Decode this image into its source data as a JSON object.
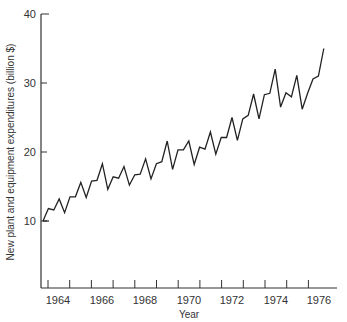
{
  "chart_data": {
    "type": "line",
    "title": "",
    "xlabel": "Year",
    "ylabel": "New plant and equipment expenditures (billion $)",
    "ylim": [
      0,
      40
    ],
    "xlim": [
      1963,
      1977
    ],
    "grid": false,
    "legend": null,
    "yticks": [
      10,
      20,
      30,
      40
    ],
    "xtick_labels": [
      "1964",
      "1966",
      "1968",
      "1970",
      "1972",
      "1974",
      "1976"
    ],
    "frequency": "quarterly",
    "x": [
      "1963Q1",
      "1963Q2",
      "1963Q3",
      "1963Q4",
      "1964Q1",
      "1964Q2",
      "1964Q3",
      "1964Q4",
      "1965Q1",
      "1965Q2",
      "1965Q3",
      "1965Q4",
      "1966Q1",
      "1966Q2",
      "1966Q3",
      "1966Q4",
      "1967Q1",
      "1967Q2",
      "1967Q3",
      "1967Q4",
      "1968Q1",
      "1968Q2",
      "1968Q3",
      "1968Q4",
      "1969Q1",
      "1969Q2",
      "1969Q3",
      "1969Q4",
      "1970Q1",
      "1970Q2",
      "1970Q3",
      "1970Q4",
      "1971Q1",
      "1971Q2",
      "1971Q3",
      "1971Q4",
      "1972Q1",
      "1972Q2",
      "1972Q3",
      "1972Q4",
      "1973Q1",
      "1973Q2",
      "1973Q3",
      "1973Q4",
      "1974Q1",
      "1974Q2",
      "1974Q3",
      "1974Q4",
      "1975Q1",
      "1975Q2",
      "1975Q3",
      "1975Q4",
      "1976Q1"
    ],
    "series": [
      {
        "name": "New plant and equipment expenditures",
        "values": [
          10.0,
          11.8,
          11.6,
          13.2,
          11.2,
          13.5,
          13.5,
          15.6,
          13.4,
          15.8,
          15.9,
          18.3,
          14.6,
          16.4,
          16.2,
          17.9,
          15.2,
          16.7,
          16.8,
          19.0,
          16.1,
          18.3,
          18.6,
          21.6,
          17.5,
          20.3,
          20.3,
          21.6,
          18.2,
          20.7,
          20.4,
          22.9,
          19.7,
          22.1,
          22.1,
          25.0,
          21.7,
          24.8,
          25.3,
          28.4,
          24.8,
          28.3,
          28.5,
          32.0,
          26.5,
          28.6,
          28.0,
          31.1,
          26.2,
          28.5,
          30.6,
          31.0,
          35.0
        ]
      }
    ]
  },
  "labels": {
    "xlabel": "Year",
    "ylabel": "New plant and equipment expenditures (billion $)",
    "yticks": [
      "10",
      "20",
      "30",
      "40"
    ],
    "xticks": [
      "1964",
      "1966",
      "1968",
      "1970",
      "1972",
      "1974",
      "1976"
    ]
  }
}
